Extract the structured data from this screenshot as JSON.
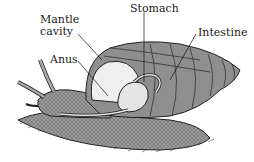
{
  "diagram": {
    "labels": [
      {
        "id": "mantle-cavity",
        "line1": "Mantle",
        "line2": "cavity"
      },
      {
        "id": "anus",
        "text": "Anus"
      },
      {
        "id": "stomach",
        "text": "Stomach"
      },
      {
        "id": "intestine",
        "text": "Intestine"
      }
    ]
  }
}
